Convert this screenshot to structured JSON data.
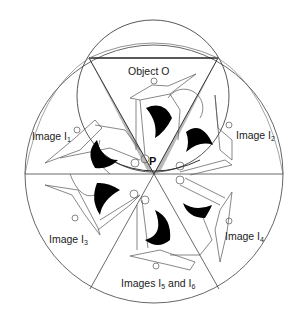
{
  "labels": {
    "object": "Object O",
    "image1": "Image I",
    "image1_sub": "1",
    "image2": "Image I",
    "image2_sub": "2",
    "image3": "Image I",
    "image3_sub": "3",
    "image4": "Image I",
    "image4_sub": "4",
    "images56_a": "Images I",
    "images56_a_sub": "5",
    "images56_b": " and I",
    "images56_b_sub": "6",
    "point": "P"
  },
  "colors": {
    "stroke": "#555555",
    "dark_stroke": "#222222",
    "fill_black": "#000000",
    "background": "#ffffff"
  }
}
